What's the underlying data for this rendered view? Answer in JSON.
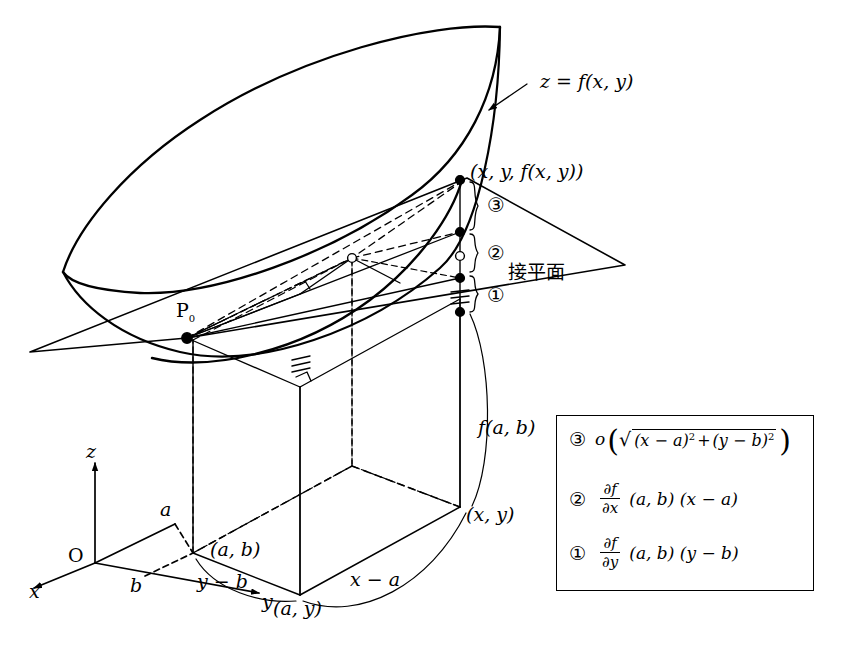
{
  "figure": {
    "title_alt": "Tangent plane to a surface z = f(x,y) at P0",
    "surface_label": "z = f(x, y)",
    "tangent_plane_label": "接平面",
    "point_p0": "P",
    "point_p0_sub": "0",
    "point_top": "(x, y, f(x, y))",
    "height_label": "f(a, b)",
    "base_point_ab": "(a, b)",
    "base_point_ay": "(a, y)",
    "base_point_xy": "(x, y)",
    "delta_x_label": "x − a",
    "delta_y_label": "y − b",
    "origin_label": "O",
    "axis_x": "x",
    "axis_y": "y",
    "axis_z": "z",
    "tick_a": "a",
    "tick_b": "b",
    "marker_1": "①",
    "marker_2": "②",
    "marker_3": "③"
  },
  "legend": {
    "rows": [
      {
        "marker": "③",
        "func": "o",
        "open_paren": "(",
        "radical": "√",
        "term1": "(x − a)",
        "term1_exp": "2",
        "plus": "+",
        "term2": "(y − b)",
        "term2_exp": "2",
        "close_paren": ")"
      },
      {
        "marker": "②",
        "frac_num": "∂f",
        "frac_den": "∂x",
        "args": "(a, b) (x − a)"
      },
      {
        "marker": "①",
        "frac_num": "∂f",
        "frac_den": "∂y",
        "args": "(a, b) (y − b)"
      }
    ]
  },
  "colors": {
    "ink": "#000000",
    "paper": "#ffffff"
  }
}
